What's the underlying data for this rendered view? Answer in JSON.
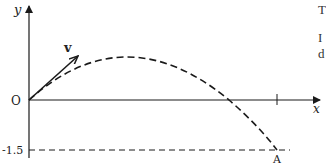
{
  "diagram": {
    "axes": {
      "x_label": "x",
      "y_label": "y",
      "origin_label": "O"
    },
    "velocity_label": "v",
    "y_marker_label": "-1.5",
    "endpoint_label": "A",
    "colors": {
      "stroke": "#1a1a1a",
      "background": "#ffffff"
    }
  },
  "side_text": {
    "line1": "T",
    "line2": "I",
    "line3": "d"
  }
}
